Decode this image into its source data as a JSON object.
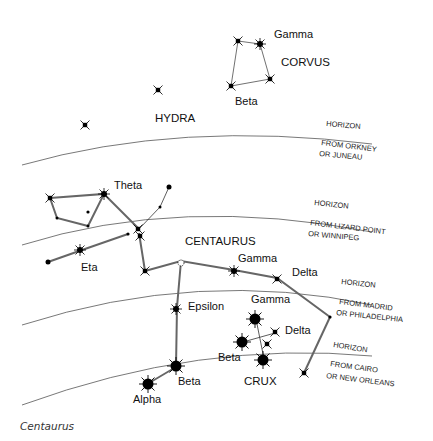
{
  "caption": "Centaurus",
  "constellations": {
    "corvus": {
      "name": "CORVUS",
      "stars": {
        "gamma": "Gamma",
        "beta": "Beta"
      }
    },
    "hydra": {
      "name": "HYDRA"
    },
    "centaurus": {
      "name": "CENTAURUS",
      "stars": {
        "theta": "Theta",
        "eta": "Eta",
        "gamma": "Gamma",
        "delta": "Delta",
        "epsilon": "Epsilon",
        "beta": "Beta",
        "alpha": "Alpha"
      }
    },
    "crux": {
      "name": "CRUX",
      "stars": {
        "gamma": "Gamma",
        "delta": "Delta",
        "beta": "Beta"
      }
    }
  },
  "horizons": [
    {
      "label": "HORIZON",
      "from_line1": "FROM ORKNEY",
      "from_line2": "OR JUNEAU"
    },
    {
      "label": "HORIZON",
      "from_line1": "FROM LIZARD POINT",
      "from_line2": "OR WINNIPEG"
    },
    {
      "label": "HORIZON",
      "from_line1": "FROM MADRID",
      "from_line2": "OR PHILADELPHIA"
    },
    {
      "label": "HORIZON",
      "from_line1": "FROM CAIRO",
      "from_line2": "OR NEW ORLEANS"
    }
  ]
}
